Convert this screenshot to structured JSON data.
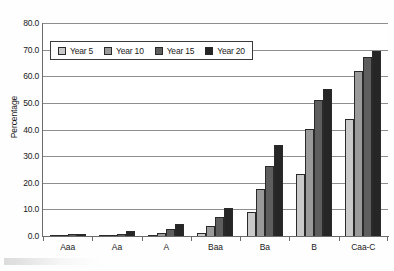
{
  "chart_data": {
    "type": "bar",
    "title": "",
    "xlabel": "",
    "ylabel": "Percentage",
    "ylim": [
      0.0,
      80.0
    ],
    "ytick_labels": [
      "80.0",
      "70.0",
      "60.0",
      "50.0",
      "40.0",
      "30.0",
      "20.0",
      "10.0",
      "0.0"
    ],
    "ytick_values": [
      80.0,
      70.0,
      60.0,
      50.0,
      40.0,
      30.0,
      20.0,
      10.0,
      0.0
    ],
    "grid": true,
    "legend_position": "upper left inside",
    "categories": [
      "Aaa",
      "Aa",
      "A",
      "Baa",
      "Ba",
      "B",
      "Caa-C"
    ],
    "series": [
      {
        "name": "Year 5",
        "color": "#c9c9c9",
        "values": [
          0.0,
          0.1,
          0.4,
          1.3,
          9.2,
          23.2,
          43.8
        ]
      },
      {
        "name": "Year 10",
        "color": "#9a9a9a",
        "values": [
          0.1,
          0.3,
          1.3,
          3.8,
          17.5,
          40.1,
          62.1
        ]
      },
      {
        "name": "Year 15",
        "color": "#5e5e5e",
        "values": [
          0.6,
          0.9,
          2.6,
          7.1,
          26.4,
          51.0,
          67.4
        ]
      },
      {
        "name": "Year 20",
        "color": "#262626",
        "values": [
          0.9,
          1.7,
          4.6,
          10.7,
          34.0,
          55.1,
          69.6
        ]
      }
    ]
  },
  "legend": {
    "items": [
      {
        "label": "Year 5"
      },
      {
        "label": "Year 10"
      },
      {
        "label": "Year 15"
      },
      {
        "label": "Year 20"
      }
    ]
  }
}
